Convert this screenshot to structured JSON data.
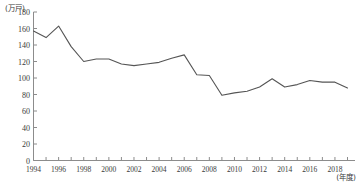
{
  "chart_data": {
    "type": "line",
    "title": "",
    "xlabel": "(年度)",
    "ylabel": "(万戸)",
    "yunit_text": "(万戸)",
    "xunit_text": "(年度)",
    "grid": false,
    "legend": "none",
    "ylim": [
      0,
      180
    ],
    "ytick_step": 20,
    "ytick_labels": [
      "0",
      "20",
      "40",
      "60",
      "80",
      "100",
      "120",
      "140",
      "160",
      "180"
    ],
    "ytick_values": [
      0,
      20,
      40,
      60,
      80,
      100,
      120,
      140,
      160,
      180
    ],
    "xlim": [
      1994,
      2019
    ],
    "xtick_labels": [
      "1994",
      "1996",
      "1998",
      "2000",
      "2002",
      "2004",
      "2006",
      "2008",
      "2010",
      "2012",
      "2014",
      "2016",
      "2018"
    ],
    "xtick_values": [
      1994,
      1996,
      1998,
      2000,
      2002,
      2004,
      2006,
      2008,
      2010,
      2012,
      2014,
      2016,
      2018
    ],
    "x": [
      1994,
      1995,
      1996,
      1997,
      1998,
      1999,
      2000,
      2001,
      2002,
      2003,
      2004,
      2005,
      2006,
      2007,
      2008,
      2009,
      2010,
      2011,
      2012,
      2013,
      2014,
      2015,
      2016,
      2017,
      2018,
      2019
    ],
    "series": [
      {
        "name": "新設住宅着工戸数",
        "color": "#555555",
        "values": [
          157,
          149,
          163,
          138,
          120,
          123,
          123,
          117,
          115,
          117,
          119,
          124,
          128,
          104,
          103,
          79,
          82,
          84,
          89,
          99,
          89,
          92,
          97,
          95,
          95,
          88
        ]
      }
    ]
  }
}
